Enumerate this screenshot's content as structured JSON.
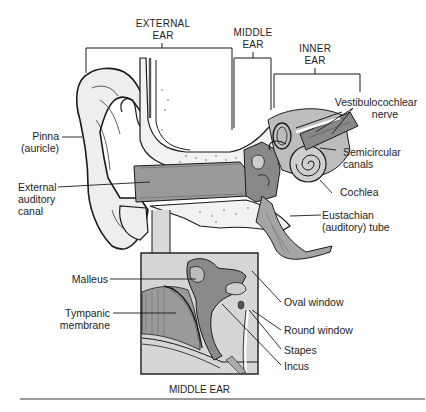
{
  "diagram": {
    "type": "anatomical-cross-section",
    "colors": {
      "line": "#1a1a1a",
      "skin_fill": "#eeeeee",
      "canal_fill": "#9a9a9a",
      "bone_fill": "#f2f2f2",
      "dark_fill": "#7a7a7a",
      "inset_bg": "#d6d6d6",
      "rule": "#9a9a9a"
    },
    "region_headers": [
      {
        "id": "external",
        "line1": "EXTERNAL",
        "line2": "EAR"
      },
      {
        "id": "middle",
        "line1": "MIDDLE",
        "line2": "EAR"
      },
      {
        "id": "inner",
        "line1": "INNER",
        "line2": "EAR"
      }
    ],
    "labels": {
      "pinna": {
        "line1": "Pinna",
        "line2": "(auricle)"
      },
      "external_canal": {
        "line1": "External",
        "line2": "auditory",
        "line3": "canal"
      },
      "vestibulocochlear": {
        "line1": "Vestibulocochlear",
        "line2": "nerve"
      },
      "semicircular": {
        "line1": "Semicircular",
        "line2": "canals"
      },
      "cochlea": {
        "line1": "Cochlea"
      },
      "eustachian": {
        "line1": "Eustachian",
        "line2": "(auditory) tube"
      },
      "malleus": {
        "line1": "Malleus"
      },
      "tympanic": {
        "line1": "Tympanic",
        "line2": "membrane"
      },
      "oval_window": {
        "line1": "Oval window"
      },
      "round_window": {
        "line1": "Round window"
      },
      "stapes": {
        "line1": "Stapes"
      },
      "incus": {
        "line1": "Incus"
      }
    },
    "inset": {
      "caption": "MIDDLE EAR"
    }
  }
}
